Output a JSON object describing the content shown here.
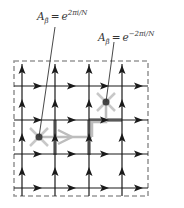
{
  "figure": {
    "type": "lattice-gauge-diagram",
    "labels": [
      {
        "id": "label-positive-phase",
        "base": "A",
        "subscript": "β̄",
        "equals": "=",
        "exp_base": "e",
        "exponent": "2πi/N"
      },
      {
        "id": "label-negative-phase",
        "base": "A",
        "subscript": "β̄",
        "equals": "=",
        "exp_base": "e",
        "exponent": "−2πi/N"
      }
    ],
    "grid": {
      "vertical_lines_x": [
        22,
        55,
        89,
        122
      ],
      "horizontal_lines_y": [
        86,
        120,
        154,
        188
      ],
      "up_arrow_y": [
        70,
        104,
        138,
        172
      ],
      "right_arrow_x": [
        37,
        71,
        104,
        138
      ],
      "arrow_direction_vertical": "up",
      "arrow_direction_horizontal": "right"
    },
    "boundary": {
      "x": 14,
      "y": 61,
      "width": 134,
      "height": 135,
      "style": "dashed"
    },
    "defects": [
      {
        "id": "defect-left",
        "x": 39,
        "y": 137
      },
      {
        "id": "defect-right",
        "x": 106,
        "y": 102
      }
    ],
    "colors": {
      "line": "#1a1a1a",
      "highlight": "#9a9a9a",
      "path": "#bdbdbd",
      "boundary": "#999999",
      "dot": "#444444"
    }
  }
}
